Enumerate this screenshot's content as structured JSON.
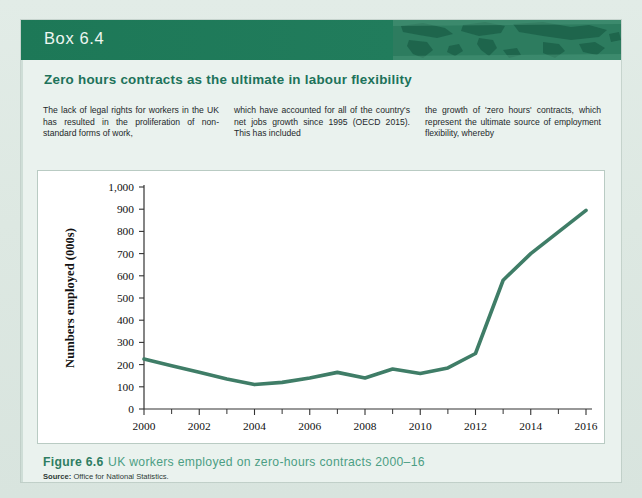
{
  "box": {
    "label": "Box 6.4",
    "subtitle": "Zero hours contracts as the ultimate in labour flexibility",
    "accent_color": "#1f7a5a",
    "subtitle_color": "#20725a"
  },
  "body": {
    "columns": [
      "The lack of legal rights for workers in the UK has resulted in the proliferation of non-standard forms of work,",
      "which have accounted for all of the country's net jobs growth since 1995 (OECD 2015). This has included",
      "the growth of 'zero hours' contracts, which represent the ultimate source of employment flexibility, whereby"
    ]
  },
  "caption": {
    "figure_number": "Figure 6.6",
    "figure_text": "UK workers employed on zero-hours contracts 2000–16",
    "source_label": "Source:",
    "source_text": "Office for National Statistics."
  },
  "chart_data": {
    "type": "line",
    "title": "UK workers employed on zero-hours contracts 2000–16",
    "xlabel": "",
    "ylabel": "Numbers employed (000s)",
    "ylim": [
      0,
      1000
    ],
    "xlim": [
      2000,
      2016
    ],
    "ytick_labels": [
      "0",
      "100",
      "200",
      "300",
      "400",
      "500",
      "600",
      "700",
      "800",
      "900",
      "1,000"
    ],
    "yticks": [
      0,
      100,
      200,
      300,
      400,
      500,
      600,
      700,
      800,
      900,
      1000
    ],
    "xtick_labels": [
      "2000",
      "2002",
      "2004",
      "2006",
      "2008",
      "2010",
      "2012",
      "2014",
      "2016"
    ],
    "xticks_major": [
      2000,
      2002,
      2004,
      2006,
      2008,
      2010,
      2012,
      2014,
      2016
    ],
    "xticks_minor": [
      2001,
      2003,
      2005,
      2007,
      2009,
      2011,
      2013,
      2015
    ],
    "grid": false,
    "legend": "none",
    "line_color": "#3f7d67",
    "series": [
      {
        "name": "Numbers employed on zero-hours contracts (000s)",
        "x": [
          2000,
          2001,
          2002,
          2003,
          2004,
          2005,
          2006,
          2007,
          2008,
          2009,
          2010,
          2011,
          2012,
          2013,
          2014,
          2016
        ],
        "values": [
          225,
          195,
          165,
          135,
          110,
          120,
          140,
          165,
          140,
          180,
          160,
          185,
          250,
          580,
          700,
          895
        ]
      }
    ]
  }
}
